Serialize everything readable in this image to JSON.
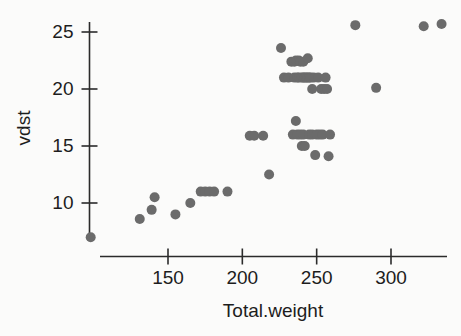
{
  "chart_data": {
    "type": "scatter",
    "title": "",
    "xlabel": "Total.weight",
    "ylabel": "vdst",
    "xlim": [
      95,
      338
    ],
    "ylim": [
      6.2,
      26.6
    ],
    "grid": false,
    "legend": "none",
    "marker": {
      "shape": "circle",
      "color": "#6b6b6b",
      "size_px": 10
    },
    "axis": {
      "line_color": "#2b2b2b",
      "x_ticks": [
        150,
        200,
        250,
        300
      ],
      "x_tick_labels": [
        "150",
        "200",
        "250",
        "300"
      ],
      "y_ticks": [
        10,
        15,
        20,
        25
      ],
      "y_tick_labels": [
        "10",
        "15",
        "20",
        "25"
      ]
    },
    "series": [
      {
        "name": "observations",
        "points": [
          [
            98,
            7.0
          ],
          [
            131,
            8.6
          ],
          [
            139,
            9.4
          ],
          [
            141,
            10.5
          ],
          [
            155,
            9.0
          ],
          [
            165,
            10.0
          ],
          [
            172,
            11.0
          ],
          [
            175,
            11.0
          ],
          [
            178,
            11.0
          ],
          [
            181,
            11.0
          ],
          [
            190,
            11.0
          ],
          [
            205,
            15.9
          ],
          [
            208,
            15.9
          ],
          [
            214,
            15.9
          ],
          [
            218,
            12.5
          ],
          [
            226,
            23.6
          ],
          [
            228,
            21.0
          ],
          [
            231,
            21.0
          ],
          [
            233,
            22.4
          ],
          [
            234,
            16.0
          ],
          [
            235,
            22.4
          ],
          [
            235,
            21.0
          ],
          [
            236,
            22.5
          ],
          [
            236,
            17.2
          ],
          [
            237,
            21.0
          ],
          [
            237,
            16.0
          ],
          [
            238,
            22.5
          ],
          [
            238,
            21.0
          ],
          [
            239,
            22.4
          ],
          [
            239,
            16.0
          ],
          [
            240,
            21.0
          ],
          [
            240,
            15.0
          ],
          [
            241,
            22.4
          ],
          [
            241,
            21.0
          ],
          [
            241,
            16.0
          ],
          [
            242,
            21.0
          ],
          [
            242,
            15.0
          ],
          [
            243,
            21.0
          ],
          [
            244,
            22.7
          ],
          [
            244,
            21.0
          ],
          [
            245,
            21.0
          ],
          [
            245,
            16.0
          ],
          [
            246,
            21.0
          ],
          [
            247,
            20.0
          ],
          [
            247,
            16.0
          ],
          [
            248,
            21.0
          ],
          [
            249,
            14.2
          ],
          [
            250,
            16.0
          ],
          [
            251,
            21.0
          ],
          [
            252,
            16.0
          ],
          [
            253,
            20.0
          ],
          [
            254,
            16.0
          ],
          [
            255,
            20.0
          ],
          [
            256,
            21.0
          ],
          [
            257,
            20.0
          ],
          [
            258,
            14.1
          ],
          [
            259,
            16.0
          ],
          [
            276,
            25.6
          ],
          [
            290,
            20.1
          ],
          [
            322,
            25.5
          ],
          [
            334,
            25.7
          ]
        ]
      }
    ]
  }
}
